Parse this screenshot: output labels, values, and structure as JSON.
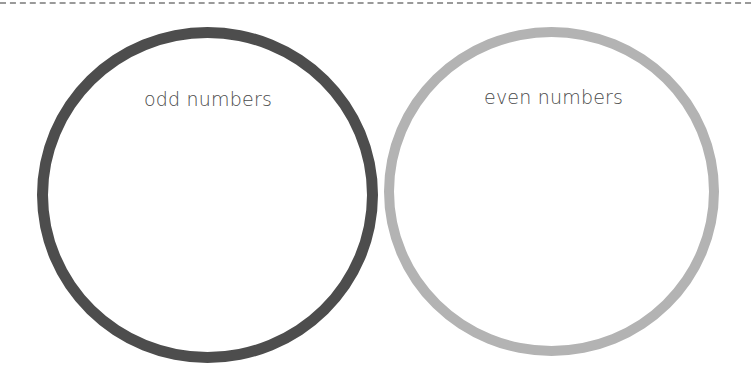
{
  "diagram": {
    "type": "two-set classification",
    "sets": [
      {
        "label": "odd numbers",
        "ring_color": "#4d4d4d"
      },
      {
        "label": "even numbers",
        "ring_color": "#b3b3b3"
      }
    ],
    "top_border": "dashed cut line"
  }
}
